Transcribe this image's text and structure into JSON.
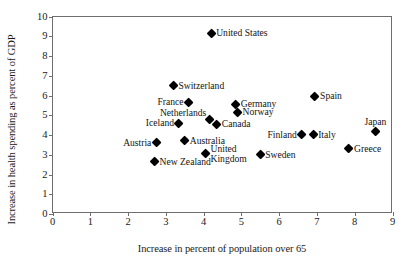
{
  "chart_data": {
    "type": "scatter",
    "title": "",
    "xlabel": "Increase in percent of population over 65",
    "ylabel": "Increase in health spending as percent of GDP",
    "xlim": [
      0,
      9
    ],
    "ylim": [
      0,
      10
    ],
    "xticks": [
      "0",
      "1",
      "2",
      "3",
      "4",
      "5",
      "6",
      "7",
      "8",
      "9"
    ],
    "yticks": [
      "0",
      "1",
      "2",
      "3",
      "4",
      "5",
      "6",
      "7",
      "8",
      "9",
      "10"
    ],
    "grid": false,
    "legend": "none",
    "marker": "filled-diamond",
    "marker_color": "#000000",
    "points": [
      {
        "label": "United States",
        "x": 4.2,
        "y": 9.15,
        "pos": "right"
      },
      {
        "label": "Switzerland",
        "x": 3.2,
        "y": 6.5,
        "pos": "right"
      },
      {
        "label": "Spain",
        "x": 6.95,
        "y": 5.95,
        "pos": "right"
      },
      {
        "label": "France",
        "x": 3.6,
        "y": 5.65,
        "pos": "left"
      },
      {
        "label": "Germany",
        "x": 4.85,
        "y": 5.55,
        "pos": "right"
      },
      {
        "label": "Norway",
        "x": 4.9,
        "y": 5.15,
        "pos": "right"
      },
      {
        "label": "Netherlands",
        "x": 4.15,
        "y": 4.8,
        "pos": "left-up"
      },
      {
        "label": "Iceland",
        "x": 3.35,
        "y": 4.6,
        "pos": "left"
      },
      {
        "label": "Canada",
        "x": 4.35,
        "y": 4.55,
        "pos": "right"
      },
      {
        "label": "Japan",
        "x": 8.55,
        "y": 4.15,
        "pos": "above"
      },
      {
        "label": "Finland",
        "x": 6.6,
        "y": 4.0,
        "pos": "left"
      },
      {
        "label": "Italy",
        "x": 6.9,
        "y": 4.0,
        "pos": "right"
      },
      {
        "label": "Australia",
        "x": 3.5,
        "y": 3.7,
        "pos": "right"
      },
      {
        "label": "Austria",
        "x": 2.75,
        "y": 3.6,
        "pos": "left"
      },
      {
        "label": "Greece",
        "x": 7.85,
        "y": 3.3,
        "pos": "right"
      },
      {
        "label": "United\nKingdom",
        "x": 4.05,
        "y": 3.05,
        "pos": "right"
      },
      {
        "label": "Sweden",
        "x": 5.5,
        "y": 3.0,
        "pos": "right"
      },
      {
        "label": "New Zealand",
        "x": 2.7,
        "y": 2.65,
        "pos": "right"
      }
    ]
  }
}
